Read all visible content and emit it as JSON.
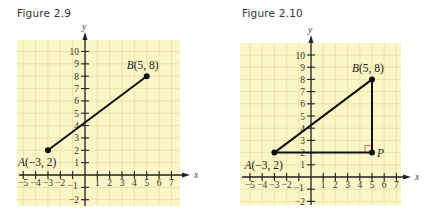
{
  "figures": [
    {
      "title": "Figure 2.9",
      "x_axis_label": "x",
      "y_axis_label": "y",
      "x_ticks": [
        -5,
        -4,
        -3,
        -2,
        -1,
        1,
        2,
        3,
        4,
        5,
        6,
        7
      ],
      "y_ticks": [
        -2,
        -1,
        1,
        2,
        3,
        4,
        5,
        6,
        7,
        8,
        9,
        10
      ],
      "points": [
        {
          "name": "A",
          "x": -3,
          "y": 2,
          "label": "A(−3, 2)"
        },
        {
          "name": "B",
          "x": 5,
          "y": 8,
          "label": "B(5, 8)"
        }
      ],
      "segments": [
        [
          "A",
          "B"
        ]
      ]
    },
    {
      "title": "Figure 2.10",
      "x_axis_label": "x",
      "y_axis_label": "y",
      "x_ticks": [
        -5,
        -4,
        -3,
        -2,
        -1,
        1,
        2,
        3,
        4,
        5,
        6,
        7
      ],
      "y_ticks": [
        -2,
        -1,
        1,
        2,
        3,
        4,
        5,
        6,
        7,
        8,
        9,
        10
      ],
      "points": [
        {
          "name": "A",
          "x": -3,
          "y": 2,
          "label": "A(−3, 2)"
        },
        {
          "name": "B",
          "x": 5,
          "y": 8,
          "label": "B(5, 8)"
        },
        {
          "name": "P",
          "x": 5,
          "y": 2,
          "label": "P"
        }
      ],
      "segments": [
        [
          "A",
          "B"
        ],
        [
          "B",
          "P"
        ],
        [
          "A",
          "P"
        ]
      ],
      "right_angle_at": "P"
    }
  ],
  "colors": {
    "grid_background": "#fbf6c8",
    "grid_line": "#e6dfa0",
    "axis": "#222222",
    "segment": "#111111",
    "right_angle_marker": "#d9534f"
  }
}
